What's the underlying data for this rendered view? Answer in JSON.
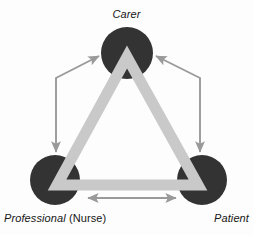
{
  "figure": {
    "type": "relationship-triangle-diagram",
    "background_color": "#fdfdfd"
  },
  "nodes": [
    {
      "id": "carer",
      "label": "Carer",
      "label_style": "italic",
      "shape": "circle",
      "fill": "#333333",
      "cx": 127,
      "cy": 53,
      "r": 26
    },
    {
      "id": "professional",
      "label": "Professional",
      "label_suffix": " (Nurse)",
      "label_style": "italic",
      "shape": "circle",
      "fill": "#333333",
      "cx": 55,
      "cy": 180,
      "r": 25
    },
    {
      "id": "patient",
      "label": "Patient",
      "label_style": "italic",
      "shape": "circle",
      "fill": "#333333",
      "cx": 202,
      "cy": 180,
      "r": 25
    }
  ],
  "triangle": {
    "name": "connecting-triangle",
    "stroke": "#c9c9c9",
    "stroke_width": 11,
    "points": "127,57 198,185 57,185"
  },
  "arrows": {
    "stroke": "#9a9a9a",
    "stroke_width": 2,
    "head_fill": "#9a9a9a",
    "items": [
      {
        "id": "arrow-professional-carer",
        "from": "professional",
        "to": "carer",
        "direction": "double",
        "kind": "bent",
        "path": "M 56,155 L 56,78 L 98,56"
      },
      {
        "id": "arrow-patient-carer",
        "from": "patient",
        "to": "carer",
        "direction": "double",
        "kind": "bent",
        "path": "M 200,155 L 200,78 L 157,56"
      },
      {
        "id": "arrow-professional-patient",
        "from": "professional",
        "to": "patient",
        "direction": "double",
        "kind": "straight",
        "path": "M 87,198 L 177,198"
      }
    ]
  }
}
